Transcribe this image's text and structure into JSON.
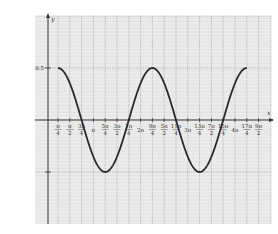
{
  "chart_data": {
    "type": "line",
    "title": "",
    "xlabel": "x",
    "ylabel": "y",
    "function": "y = 0.5·cos(x − π/4)",
    "domain": [
      "π/4",
      "17π/4"
    ],
    "ylim": [
      -0.85,
      0.85
    ],
    "grid": true,
    "legend": null,
    "y_ticks": [
      {
        "value": 0.5,
        "label": "0.5"
      },
      {
        "value": -0.5,
        "label": ""
      }
    ],
    "x_ticks": [
      {
        "k": 1,
        "num": "π",
        "den": "4"
      },
      {
        "k": 2,
        "num": "π",
        "den": "2"
      },
      {
        "k": 3,
        "num": "3π",
        "den": "4"
      },
      {
        "k": 4,
        "num": "π",
        "den": ""
      },
      {
        "k": 5,
        "num": "5π",
        "den": "4"
      },
      {
        "k": 6,
        "num": "3π",
        "den": "2"
      },
      {
        "k": 7,
        "num": "7π",
        "den": "4"
      },
      {
        "k": 8,
        "num": "2π",
        "den": ""
      },
      {
        "k": 9,
        "num": "9π",
        "den": "4"
      },
      {
        "k": 10,
        "num": "5π",
        "den": "2"
      },
      {
        "k": 11,
        "num": "11π",
        "den": "4"
      },
      {
        "k": 12,
        "num": "3π",
        "den": ""
      },
      {
        "k": 13,
        "num": "13π",
        "den": "4"
      },
      {
        "k": 14,
        "num": "7π",
        "den": "2"
      },
      {
        "k": 15,
        "num": "15π",
        "den": "4"
      },
      {
        "k": 16,
        "num": "4π",
        "den": ""
      },
      {
        "k": 17,
        "num": "17π",
        "den": "4"
      },
      {
        "k": 18,
        "num": "9π",
        "den": "2"
      }
    ],
    "key_points": [
      {
        "x": "π/4",
        "y": 0.5
      },
      {
        "x": "3π/4",
        "y": 0
      },
      {
        "x": "5π/4",
        "y": -0.5
      },
      {
        "x": "7π/4",
        "y": 0
      },
      {
        "x": "9π/4",
        "y": 0.5
      },
      {
        "x": "11π/4",
        "y": 0
      },
      {
        "x": "13π/4",
        "y": -0.5
      },
      {
        "x": "15π/4",
        "y": 0
      },
      {
        "x": "17π/4",
        "y": 0.5
      }
    ],
    "colors": {
      "background": "#ebebeb",
      "grid": "#9a9a9a",
      "axis": "#333333",
      "curve": "#2a2a2a"
    }
  }
}
